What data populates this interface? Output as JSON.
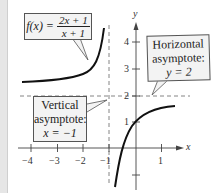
{
  "figure": {
    "function_label": {
      "prefix": "f(x) = ",
      "numerator": "2x + 1",
      "denominator": "x + 1"
    },
    "horizontal_callout": {
      "line1": "Horizontal",
      "line2": "asymptote:",
      "line3": "y = 2"
    },
    "vertical_callout": {
      "line1": "Vertical",
      "line2": "asymptote:",
      "line3": "x = −1"
    },
    "axes": {
      "x_label": "x",
      "y_label": "y"
    },
    "x_ticks": [
      "−4",
      "−3",
      "−2",
      "−1",
      "1"
    ],
    "y_ticks": [
      "4",
      "3",
      "2",
      "1"
    ],
    "colors": {
      "curve": "#111111",
      "asymptote": "#777777",
      "callout_bg": "#f3f3f3",
      "axis": "#444444"
    }
  }
}
